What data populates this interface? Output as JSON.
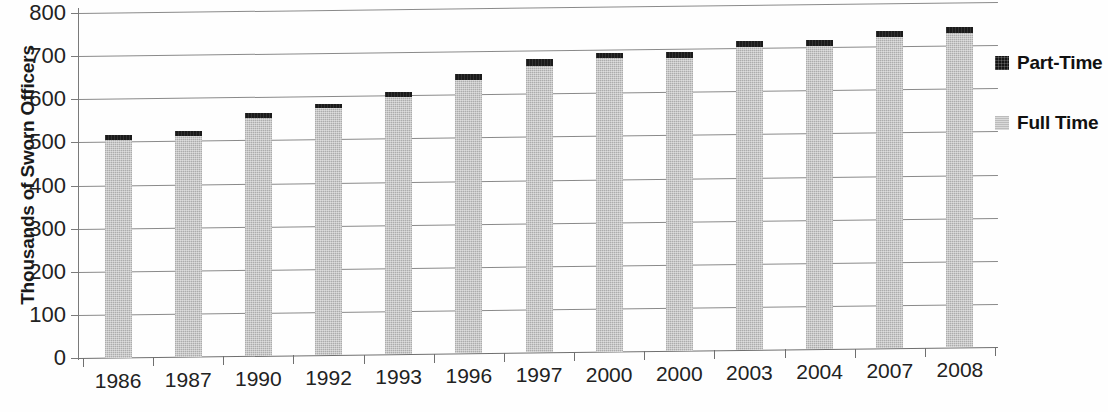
{
  "chart_data": {
    "type": "bar",
    "title": "",
    "subtitle": "",
    "xlabel": "",
    "ylabel": "Thousands of Sworn Officers",
    "categories": [
      "1986",
      "1987",
      "1990",
      "1992",
      "1993",
      "1996",
      "1997",
      "2000",
      "2000",
      "2003",
      "2004",
      "2007",
      "2008"
    ],
    "series": [
      {
        "name": "Full Time",
        "color": "#b9b9b9",
        "values": [
          504,
          512,
          551,
          572,
          596,
          634,
          664,
          681,
          679,
          702,
          702,
          722,
          730
        ]
      },
      {
        "name": "Part-Time",
        "color": "#1b1b1b",
        "values": [
          11,
          11,
          12,
          11,
          12,
          14,
          16,
          12,
          13,
          14,
          14,
          14,
          14
        ]
      }
    ],
    "totals": [
      515,
      523,
      563,
      583,
      608,
      648,
      680,
      693,
      692,
      716,
      716,
      736,
      744
    ],
    "stacked": true,
    "ylim": [
      0,
      800
    ],
    "yticks": [
      0,
      100,
      200,
      300,
      400,
      500,
      600,
      700,
      800
    ],
    "ytick_labels": [
      "0",
      "100",
      "200",
      "300",
      "400",
      "500",
      "600",
      "700",
      "800"
    ],
    "grid": true,
    "grid_axis": "y",
    "legend_position": "right",
    "legend": [
      {
        "label": "Part-Time",
        "swatch": "black-square-icon"
      },
      {
        "label": "Full Time",
        "swatch": "gray-square-icon"
      }
    ]
  }
}
